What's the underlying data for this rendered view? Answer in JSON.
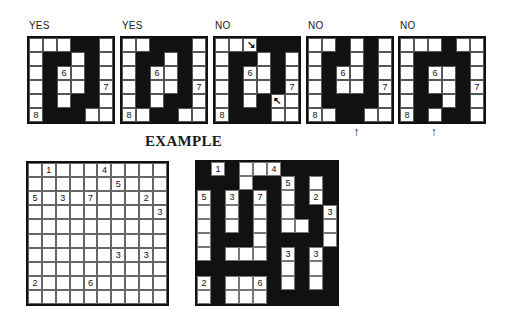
{
  "examples": [
    {
      "label": "YES",
      "rows": [
        "WWWBBW",
        "WBBWBW",
        "WBWWBW",
        "WBWWBW",
        "WBWBBW",
        "WBBBWW"
      ],
      "numbers": [
        {
          "r": 2,
          "c": 2,
          "v": "6"
        },
        {
          "r": 3,
          "c": 5,
          "v": "7"
        },
        {
          "r": 5,
          "c": 0,
          "v": "8"
        }
      ],
      "marks": []
    },
    {
      "label": "YES",
      "rows": [
        "WWBBBW",
        "WBBWBW",
        "WBWWBW",
        "WBWWBW",
        "WBWBBW",
        "WWBBWW"
      ],
      "numbers": [
        {
          "r": 2,
          "c": 2,
          "v": "6"
        },
        {
          "r": 3,
          "c": 5,
          "v": "7"
        },
        {
          "r": 5,
          "c": 0,
          "v": "8"
        }
      ],
      "marks": []
    },
    {
      "label": "NO",
      "rows": [
        "WWWBBB",
        "WBBWBW",
        "WBWWBW",
        "WBWWBW",
        "WBWBWW",
        "WBBBWW"
      ],
      "numbers": [
        {
          "r": 2,
          "c": 2,
          "v": "6"
        },
        {
          "r": 3,
          "c": 5,
          "v": "7"
        },
        {
          "r": 5,
          "c": 0,
          "v": "8"
        }
      ],
      "marks": [
        {
          "type": "diag-arrow",
          "r": 0,
          "c": 2,
          "glyph": "↘"
        },
        {
          "type": "diag-arrow",
          "r": 4,
          "c": 4,
          "glyph": "↖"
        }
      ]
    },
    {
      "label": "NO",
      "rows": [
        "WWBWBW",
        "WBBWBW",
        "WBWWBW",
        "WBWWBW",
        "WBBBBW",
        "WWBBWW"
      ],
      "numbers": [
        {
          "r": 2,
          "c": 2,
          "v": "6"
        },
        {
          "r": 3,
          "c": 5,
          "v": "7"
        },
        {
          "r": 5,
          "c": 0,
          "v": "8"
        }
      ],
      "marks": [
        {
          "type": "up-arrow",
          "c": 3,
          "glyph": "↑"
        }
      ]
    },
    {
      "label": "NO",
      "rows": [
        "WWWBWW",
        "WBBBBW",
        "WBWWBW",
        "WBWWBW",
        "WBBWBW",
        "WBWBBW"
      ],
      "numbers": [
        {
          "r": 2,
          "c": 2,
          "v": "6"
        },
        {
          "r": 3,
          "c": 5,
          "v": "7"
        },
        {
          "r": 5,
          "c": 0,
          "v": "8"
        }
      ],
      "marks": [
        {
          "type": "up-arrow",
          "c": 2,
          "glyph": "↑"
        }
      ]
    }
  ],
  "example_title": "EXAMPLE",
  "puzzle": {
    "size": 10,
    "numbers": [
      {
        "r": 0,
        "c": 1,
        "v": "1"
      },
      {
        "r": 0,
        "c": 5,
        "v": "4"
      },
      {
        "r": 1,
        "c": 6,
        "v": "5"
      },
      {
        "r": 2,
        "c": 0,
        "v": "5"
      },
      {
        "r": 2,
        "c": 2,
        "v": "3"
      },
      {
        "r": 2,
        "c": 4,
        "v": "7"
      },
      {
        "r": 2,
        "c": 8,
        "v": "2"
      },
      {
        "r": 3,
        "c": 9,
        "v": "3"
      },
      {
        "r": 6,
        "c": 6,
        "v": "3"
      },
      {
        "r": 6,
        "c": 8,
        "v": "3"
      },
      {
        "r": 8,
        "c": 0,
        "v": "2"
      },
      {
        "r": 8,
        "c": 4,
        "v": "6"
      }
    ]
  },
  "solution": {
    "rows": [
      "BWBWWWBBBB",
      "BBBWBBWBWB",
      "WBWBWBWBWB",
      "WBWBWBWBBW",
      "WBWBWBWWBW",
      "WBBBWBBBBW",
      "WBWWWBWBWB",
      "BBBBBBWBWB",
      "WBWWWBWBWB",
      "WBWWWBBBBB"
    ]
  },
  "colors": {
    "black": "#111111",
    "white": "#ffffff"
  }
}
